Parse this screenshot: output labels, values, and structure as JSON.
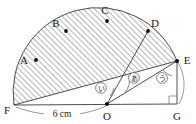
{
  "figure": {
    "background_color": "#ffffff",
    "line_color": "#3a3a3a",
    "hatch_color": "#7a7a7a",
    "points": [
      {
        "id": "A",
        "label": "A",
        "x": 36,
        "y": 60,
        "label_x": 24,
        "label_y": 60
      },
      {
        "id": "B",
        "label": "B",
        "x": 66,
        "y": 31,
        "label_x": 56,
        "label_y": 26
      },
      {
        "id": "C",
        "label": "C",
        "x": 107,
        "y": 21,
        "label_x": 104,
        "label_y": 13
      },
      {
        "id": "D",
        "label": "D",
        "x": 148,
        "y": 31,
        "label_x": 152,
        "label_y": 26
      },
      {
        "id": "E",
        "label": "E",
        "x": 177,
        "y": 61,
        "label_x": 183,
        "label_y": 62
      },
      {
        "id": "F",
        "label": "F",
        "x": 14,
        "y": 105,
        "label_x": 6,
        "label_y": 110
      },
      {
        "id": "O",
        "label": "O",
        "x": 107,
        "y": 104,
        "label_x": 104,
        "label_y": 117
      },
      {
        "id": "G",
        "label": "G",
        "x": 177,
        "y": 104,
        "label_x": 174,
        "label_y": 117
      }
    ],
    "dimension": {
      "label": "6 cm",
      "label_x": 61,
      "label_y": 117,
      "from": "F",
      "to": "O"
    },
    "angle_labels": [
      {
        "id": "a",
        "label": "あ",
        "x": 134,
        "y": 79,
        "vertex": "O"
      },
      {
        "id": "i",
        "label": "い",
        "x": 102,
        "y": 88,
        "vertex": "F"
      },
      {
        "id": "u",
        "label": "う",
        "x": 162,
        "y": 78,
        "vertex": "E"
      }
    ],
    "right_angle": {
      "at": "G",
      "size": 8
    },
    "shaded_region": {
      "pattern": "diagonal-hatch",
      "description": "Region bounded by segment F-E and the arc through A, B, C, D"
    }
  }
}
